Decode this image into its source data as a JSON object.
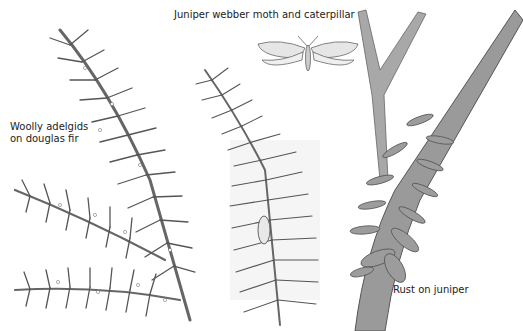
{
  "labels": {
    "adelgids_line1": "Woolly adelgids",
    "adelgids_line2": "on douglas fir",
    "moth": "Juniper webber moth and caterpillar",
    "rust": "Rust on juniper"
  },
  "illustrations": [
    {
      "name": "douglas-fir-branch",
      "subject": "Woolly adelgids on douglas fir"
    },
    {
      "name": "juniper-webber-moth",
      "subject": "Juniper webber moth"
    },
    {
      "name": "juniper-sprig-with-caterpillar",
      "subject": "Juniper webber caterpillar in web"
    },
    {
      "name": "juniper-branch-with-rust",
      "subject": "Rust on juniper"
    }
  ],
  "colors": {
    "ink": "#555555",
    "bark": "#8a8a8a",
    "rust_gall": "#9a9a9a",
    "background": "#ffffff"
  }
}
